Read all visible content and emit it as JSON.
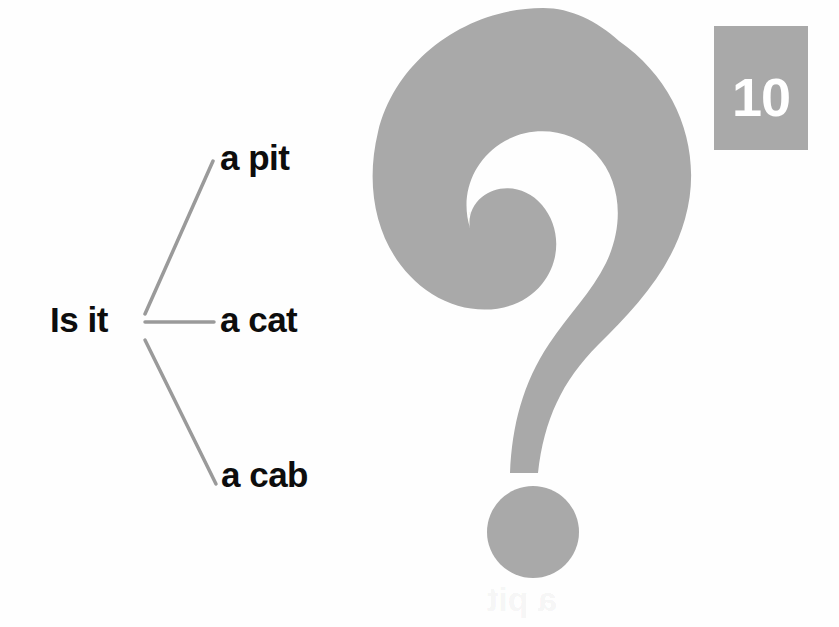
{
  "page": {
    "number_badge": "10",
    "background_color": "#ffffff"
  },
  "graphic": {
    "icon": "question-mark",
    "color": "#a9a9a9",
    "description": "large gray question mark"
  },
  "diagram": {
    "type": "branching-choice",
    "root_label": "Is it",
    "line_color": "#9a9a9a",
    "options": [
      {
        "label": "a pit"
      },
      {
        "label": "a cat"
      },
      {
        "label": "a cab"
      }
    ]
  },
  "ghost_text": {
    "line_1": "a pit",
    "line_2": "a pit"
  },
  "colors": {
    "gray_fill": "#a9a9a9",
    "text_black": "#0d0d0d",
    "badge_text": "#ffffff",
    "connector_gray": "#9a9a9a"
  }
}
